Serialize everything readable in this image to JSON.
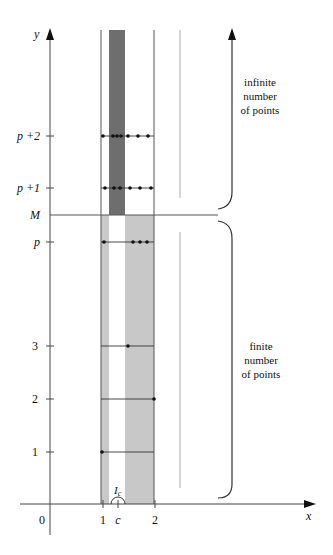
{
  "axes": {
    "y_label": "y",
    "x_label": "x",
    "y_ticks": [
      {
        "label": "p +2",
        "y": 136
      },
      {
        "label": "p +1",
        "y": 188
      },
      {
        "label": "M",
        "y": 215
      },
      {
        "label": "p",
        "y": 242
      },
      {
        "label": "3",
        "y": 346
      },
      {
        "label": "2",
        "y": 399
      },
      {
        "label": "1",
        "y": 452
      }
    ],
    "x_ticks": [
      {
        "label": "0",
        "x": 42
      },
      {
        "label": "1",
        "x": 103
      },
      {
        "label": "c",
        "x": 118
      },
      {
        "label": "2",
        "x": 155
      }
    ]
  },
  "interval_label": "I",
  "interval_subscript": "c",
  "annotations": {
    "upper": {
      "line1": "infinite",
      "line2": "number",
      "line3": "of points"
    },
    "lower": {
      "line1": "finite",
      "line2": "number",
      "line3": "of points"
    }
  },
  "colors": {
    "dark_band": "#6e6e6e",
    "light_band": "#c8c8c8",
    "line": "#555555",
    "dot": "#111111"
  },
  "rows": [
    {
      "name": "p+2",
      "y": 136,
      "dots_x": [
        103,
        113,
        117,
        121,
        128,
        138,
        148
      ]
    },
    {
      "name": "p+1",
      "y": 188,
      "dots_x": [
        105,
        114,
        120,
        130,
        140,
        151
      ]
    },
    {
      "name": "p",
      "y": 242,
      "dots_x": [
        104,
        133,
        140,
        147
      ]
    },
    {
      "name": "3",
      "y": 346,
      "dots_x": [
        128
      ]
    },
    {
      "name": "2",
      "y": 399,
      "dots_x": [
        154
      ]
    },
    {
      "name": "1",
      "y": 452,
      "dots_x": [
        102
      ]
    }
  ]
}
